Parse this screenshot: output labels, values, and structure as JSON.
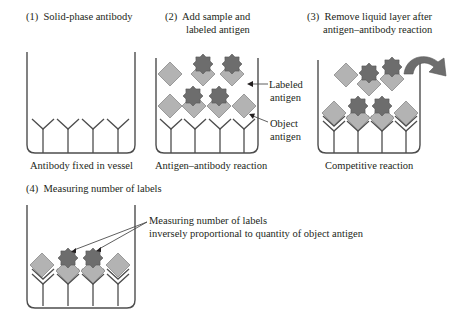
{
  "panels": [
    {
      "step": "(1)",
      "title": "Solid-phase antibody",
      "caption": "Antibody fixed in vessel"
    },
    {
      "step": "(2)",
      "title_line1": "Add sample and",
      "title_line2": "labeled antigen",
      "caption": "Antigen–antibody reaction",
      "callouts": {
        "labeled_line1": "Labeled",
        "labeled_line2": "antigen",
        "object_line1": "Object",
        "object_line2": "antigen"
      }
    },
    {
      "step": "(3)",
      "title_line1": "Remove liquid layer after",
      "title_line2": "antigen–antibody reaction",
      "caption": "Competitive reaction"
    },
    {
      "step": "(4)",
      "title": "Measuring number of labels",
      "callout_line1": "Measuring number of labels",
      "callout_line2": "inversely proportional to quantity of object antigen"
    }
  ],
  "legend": {
    "antibody": "Y-shaped solid-phase antibody",
    "object_antigen": "light grey diamond",
    "labeled_antigen": "light grey diamond with dark grey star label"
  },
  "colors": {
    "line": "#4d4d4d",
    "diamond_fill": "#b3b3b3",
    "diamond_stroke": "#8a8a8a",
    "star_fill": "#6d6d6d",
    "star_stroke": "#555555",
    "arrow_fill": "#6d6d6d"
  }
}
